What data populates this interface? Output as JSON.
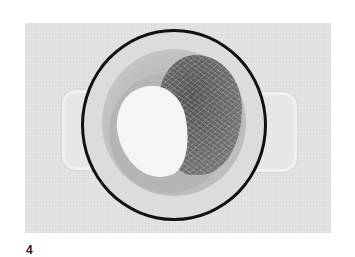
{
  "figure": {
    "step_number": "4",
    "colors": {
      "background": "#e4e4e4",
      "rim": "#111111",
      "pot_interior": "#dcdcdc",
      "noodles": "#6a6a6a",
      "sauce": "#f5f5f5"
    }
  }
}
